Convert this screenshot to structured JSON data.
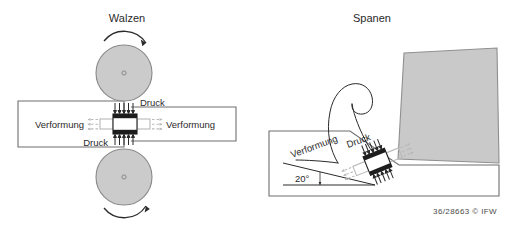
{
  "figure": {
    "left_panel": {
      "title": "Walzen",
      "roller_top": {
        "name": "roller-top",
        "rotation_arrow": "clockwise-arc-arrow"
      },
      "roller_bottom": {
        "name": "roller-bottom",
        "rotation_arrow": "counterclockwise-arc-arrow"
      },
      "labels": {
        "pressure_top": "Druck",
        "pressure_bottom": "Druck",
        "deformation_left": "Verformung",
        "deformation_right": "Verformung"
      }
    },
    "right_panel": {
      "title": "Spanen",
      "labels": {
        "deformation": "Verformung",
        "pressure": "Druck",
        "shear_angle": "20°"
      },
      "tool": {
        "name": "cutting-tool"
      },
      "chip": {
        "name": "chip-curl"
      }
    },
    "credit": "36/28663  ©  IFW"
  },
  "colors": {
    "roller_fill": "#cbcbcb",
    "roller_stroke": "#8a8a8a",
    "tool_fill": "#c9c9c9",
    "tool_stroke": "#8f8f8f",
    "outline": "#6f6f6f",
    "ink": "#2a2a2a",
    "ghost": "#b9b9b9",
    "background": "#ffffff"
  }
}
